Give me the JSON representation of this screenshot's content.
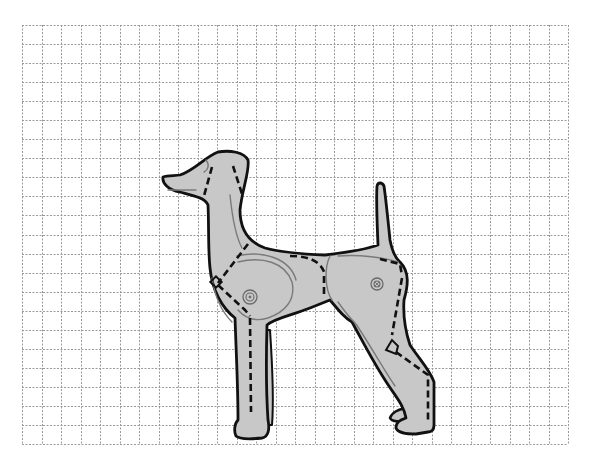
{
  "diagram": {
    "title": "Dog skeletal angulation illustration on grid",
    "grid": {
      "x0": 22,
      "y0": 25,
      "x1": 568,
      "y1": 444,
      "cols": 28,
      "rows": 22,
      "line_color": "#9a9a9a"
    },
    "colors": {
      "body_fill": "#c8c8c8",
      "outline": "#111111",
      "detail_line": "#7a7a7a",
      "bone_dash": "#111111",
      "background": "#ffffff"
    },
    "labels": {
      "head": "head",
      "neck": "neck",
      "shoulder": "shoulder",
      "shoulder_joint": "shoulder-joint",
      "ribcage": "ribcage",
      "hip_joint": "hip-joint",
      "hock": "hock",
      "tail": "tail"
    }
  }
}
